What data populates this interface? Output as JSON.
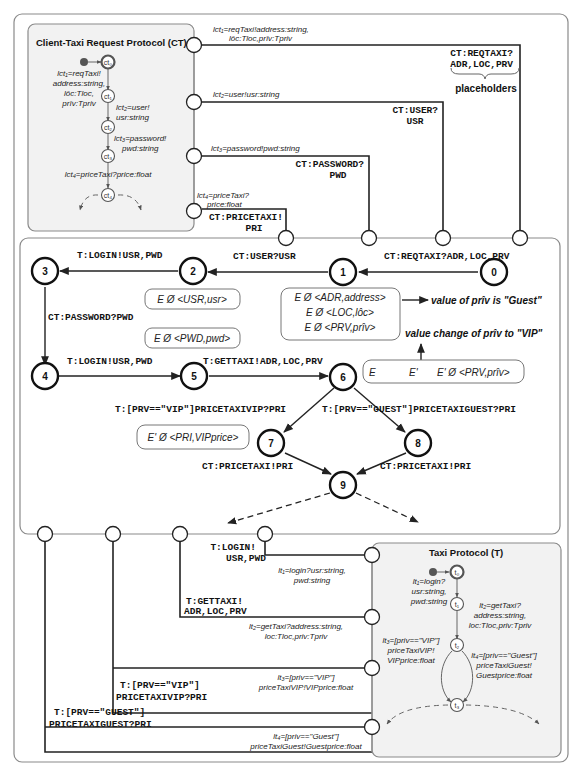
{
  "client_protocol": {
    "title": "Client-Taxi  Request Protocol (CT)",
    "states": [
      "ct₀",
      "ct₁",
      "ct₂",
      "ct₃",
      "ct₄"
    ],
    "labels": {
      "l1": [
        "lct₁=reqTaxi!",
        "address:string,",
        "lôc:Tloc,",
        "prîv:Tpriv"
      ],
      "l2": [
        "lct₂=user!",
        "usr:string"
      ],
      "l3": [
        "lct₃=password!",
        "pwd:string"
      ],
      "l4": [
        "lct₄=priceTaxi?price:float"
      ]
    }
  },
  "client_ports": {
    "p1": [
      "lct₁=reqTaxi!address:string,",
      "lôc:Tloc,prîv:Tpriv"
    ],
    "p2": [
      "lct₂=user!usr:string"
    ],
    "p3": [
      "lct₃=password!pwd:string"
    ],
    "p4": [
      "lct₄=priceTaxi?",
      "price:float"
    ]
  },
  "client_wire_labels": {
    "reqtaxi": [
      "CT:REQTAXI?",
      "ADR,LOC,PRV"
    ],
    "placeholders": "placeholders",
    "user": [
      "CT:USER?",
      "USR"
    ],
    "password": [
      "CT:PASSWORD?",
      "PWD"
    ],
    "pricetaxi": [
      "CT:PRICETAXI!",
      "PRI"
    ]
  },
  "mediator": {
    "states": [
      "0",
      "1",
      "2",
      "3",
      "4",
      "5",
      "6",
      "7",
      "8",
      "9"
    ],
    "transitions": {
      "t0_1": "CT:REQTAXI?ADR,LOC,PRV",
      "t1_2": "CT:USER?USR",
      "t2_3": "T:LOGIN!USR,PWD",
      "t3_4": "CT:PASSWORD?PWD",
      "t4_5": "T:LOGIN!USR,PWD",
      "t5_6": "T:GETTAXI!ADR,LOC,PRV",
      "t6_7": "T:[PRV==\"VIP\"]PRICETAXIVIP?PRI",
      "t6_8": "T:[PRV==\"GUEST\"]PRICETAXIGUEST?PRI",
      "t7_9": "CT:PRICETAXI!PRI",
      "t8_9": "CT:PRICETAXI!PRI"
    },
    "env_boxes": {
      "usr": "E Ø <USR,usr>",
      "pwd": "E Ø <PWD,pwd>",
      "adr": [
        "E Ø <ADR,address>",
        "E Ø <LOC,lôc>",
        "E Ø <PRV,prîv>"
      ],
      "update": [
        "E",
        "E'",
        "E' Ø <PRV,prîv>"
      ],
      "pri": "E' Ø <PRI,VIPprice>"
    },
    "annotations": {
      "guest": "value of prîv is \"Guest\"",
      "vip": "value change of prîv to \"VIP\""
    }
  },
  "taxi_wire_labels": {
    "login": [
      "T:LOGIN!",
      "USR,PWD"
    ],
    "gettaxi": [
      "T:GETTAXI!",
      "ADR,LOC,PRV"
    ],
    "vip": [
      "T:[PRV==\"VIP\"]",
      "PRICETAXIVIP?PRI"
    ],
    "guest": [
      "T:[PRV==\"GUEST\"]",
      "PRICETAXIGUEST?PRI"
    ]
  },
  "taxi_ports": {
    "p1": [
      "lt₁=login?usr:string,",
      "pwd:string"
    ],
    "p2": [
      "lt₂=getTaxi?address:string,",
      "loc:Tloc,priv:Tpriv"
    ],
    "p3": [
      "lt₃=[priv==\"VIP\"]",
      "priceTaxiVIP!VIPprice:float"
    ],
    "p4": [
      "lt₄=[priv==\"Guest\"]",
      "priceTaxiGuest!Guestprice:float"
    ]
  },
  "taxi_protocol": {
    "title": "Taxi Protocol (T)",
    "states": [
      "t₀",
      "t₁",
      "t₂",
      "t₃"
    ],
    "labels": {
      "l1": [
        "lt₁=login?",
        "usr:string,",
        "pwd:string"
      ],
      "l2": [
        "lt₂=getTaxi?",
        "address:string,",
        "loc:Tloc,priv:Tpriv"
      ],
      "l3": [
        "lt₃=[priv==\"VIP\"]",
        "priceTaxiVIP!",
        "VIPprice:float"
      ],
      "l4": [
        "lt₄=[priv==\"Guest\"]",
        "priceTaxiGuest!",
        "Guestprice:float"
      ]
    }
  }
}
